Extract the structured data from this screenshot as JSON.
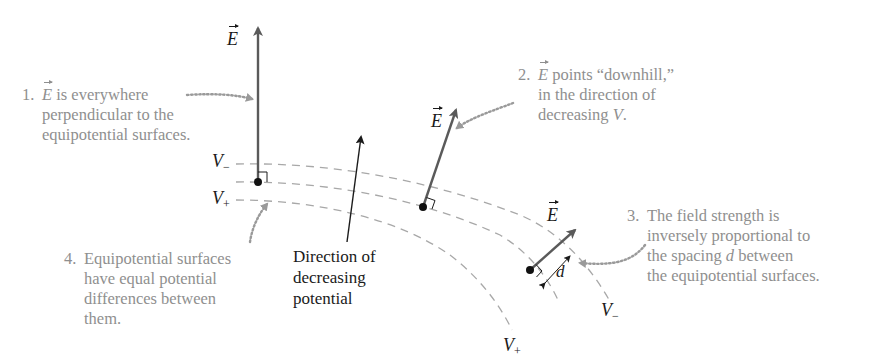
{
  "figure": {
    "colors": {
      "annotation_text": "#8f8f8f",
      "field_arrow": "#5a5a5a",
      "dark": "#1a1a1a",
      "equipotential_dash": "#a8a8a8",
      "pointer_dots": "#8f8f8f"
    },
    "vector_labels": {
      "e1": "E",
      "e2": "E",
      "e3": "E"
    },
    "potential_labels": {
      "left_minus_base": "V",
      "left_minus_sub": "−",
      "left_plus_base": "V",
      "left_plus_sub": "+",
      "right_minus_base": "V",
      "right_minus_sub": "−",
      "right_plus_base": "V",
      "right_plus_sub": "+"
    },
    "spacing_label": "d",
    "direction_caption": {
      "line1": "Direction of",
      "line2": "decreasing",
      "line3": "potential"
    },
    "notes": [
      {
        "number": "1.",
        "vec": "E",
        "lines": [
          "is everywhere",
          "perpendicular to the",
          "equipotential surfaces."
        ]
      },
      {
        "number": "2.",
        "vec": "E",
        "line1_rest": "points “downhill,”",
        "line2": "in the direction of",
        "line3_pre": "decreasing ",
        "line3_var": "V",
        "line3_post": "."
      },
      {
        "number": "3.",
        "line1": "The field strength is",
        "line2": "inversely proportional to",
        "line3_pre": "the spacing ",
        "line3_var": "d",
        "line3_post": " between",
        "line4": "the equipotential surfaces."
      },
      {
        "number": "4.",
        "lines": [
          "Equipotential surfaces",
          "have equal potential",
          "differences between",
          "them."
        ]
      }
    ]
  }
}
